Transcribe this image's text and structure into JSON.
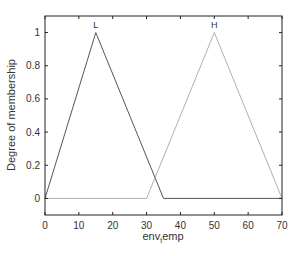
{
  "chart_data": {
    "type": "line",
    "title": "",
    "xlabel": "env_temp",
    "xlabel_main": "env",
    "xlabel_sub": "t",
    "xlabel_rest": "emp",
    "ylabel": "Degree of membership",
    "xlim": [
      0,
      70
    ],
    "ylim": [
      -0.1,
      1.1
    ],
    "xticks": [
      0,
      10,
      20,
      30,
      40,
      50,
      60,
      70
    ],
    "yticks": [
      0,
      0.2,
      0.4,
      0.6,
      0.8,
      1
    ],
    "ytick_labels": [
      "0",
      "0.2",
      "0.4",
      "0.6",
      "0.8",
      "1"
    ],
    "grid": false,
    "legend": "none",
    "series": [
      {
        "name": "L",
        "color": "#555555",
        "x": [
          0,
          15,
          35,
          70
        ],
        "y": [
          0,
          1,
          0,
          0
        ]
      },
      {
        "name": "H",
        "color": "#b0b0b0",
        "x": [
          0,
          30,
          50,
          70
        ],
        "y": [
          0,
          0,
          1,
          0
        ]
      }
    ],
    "annotations": [
      {
        "text": "L",
        "x": 15,
        "y": 1
      },
      {
        "text": "H",
        "x": 50,
        "y": 1
      }
    ]
  }
}
